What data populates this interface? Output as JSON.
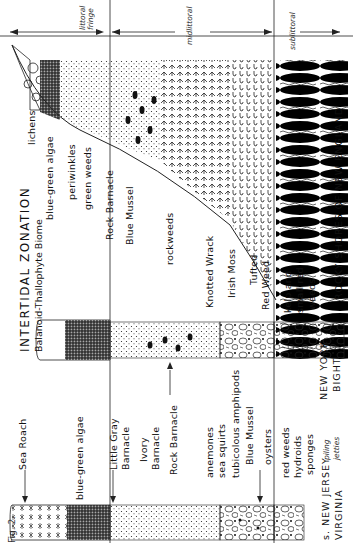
{
  "figure": {
    "fig_label": "Fig. 2.",
    "title": "INTERTIDAL ZONATION",
    "subtitle": "Balanoid-Thallophyte Biome"
  },
  "zones": {
    "littoral_fringe": "littoral fringe",
    "littoral_fringe_l1": "littoral",
    "littoral_fringe_l2": "fringe",
    "midlittoral": "midlittoral",
    "sublittoral": "sublittoral"
  },
  "profiles": [
    {
      "region": "ROCKY SHORES OF NEW ENGLAND",
      "labels": {
        "fringe": [
          "lichens",
          "blue-green algae",
          "periwinkles",
          "green weeds"
        ],
        "mid": [
          "Rock Barnacle",
          "Blue Mussel",
          "rockweeds",
          "Knotted Wrack",
          "Irish Moss",
          "Tufted",
          "Red Weed"
        ],
        "sub": [
          "kelp and",
          "small red",
          "weeds"
        ]
      }
    },
    {
      "region_l1": "NEW YORK",
      "region_l2": "BIGHT"
    },
    {
      "region_l1": "s. NEW JERSEY",
      "region_l2": "VIRGINIA",
      "habitat_l1": "piling",
      "habitat_l2": "jetties",
      "labels": {
        "fringe": [
          "Sea Roach",
          "blue-green algae"
        ],
        "mid": [
          "Little Gray",
          "Barnacle",
          "Ivory",
          "Barnacle",
          "Rock Barnacle",
          "anemones",
          "sea squirts",
          "tubicolous amphipods",
          "Blue Mussel",
          "oysters"
        ],
        "sub": [
          "red weeds",
          "hydroids",
          "sponges"
        ]
      }
    }
  ]
}
